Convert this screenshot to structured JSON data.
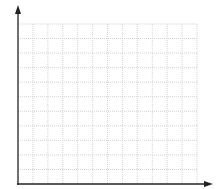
{
  "chart_data": {
    "type": "line",
    "title": "",
    "xlabel": "",
    "ylabel": "",
    "series": [],
    "grid": true,
    "grid_columns": 12,
    "grid_rows": 11,
    "grid_style": "dotted",
    "axes": {
      "x_arrow": true,
      "y_arrow": true
    },
    "colors": {
      "axis": "#222222",
      "grid": "#c8c8c8",
      "background": "#ffffff"
    }
  }
}
